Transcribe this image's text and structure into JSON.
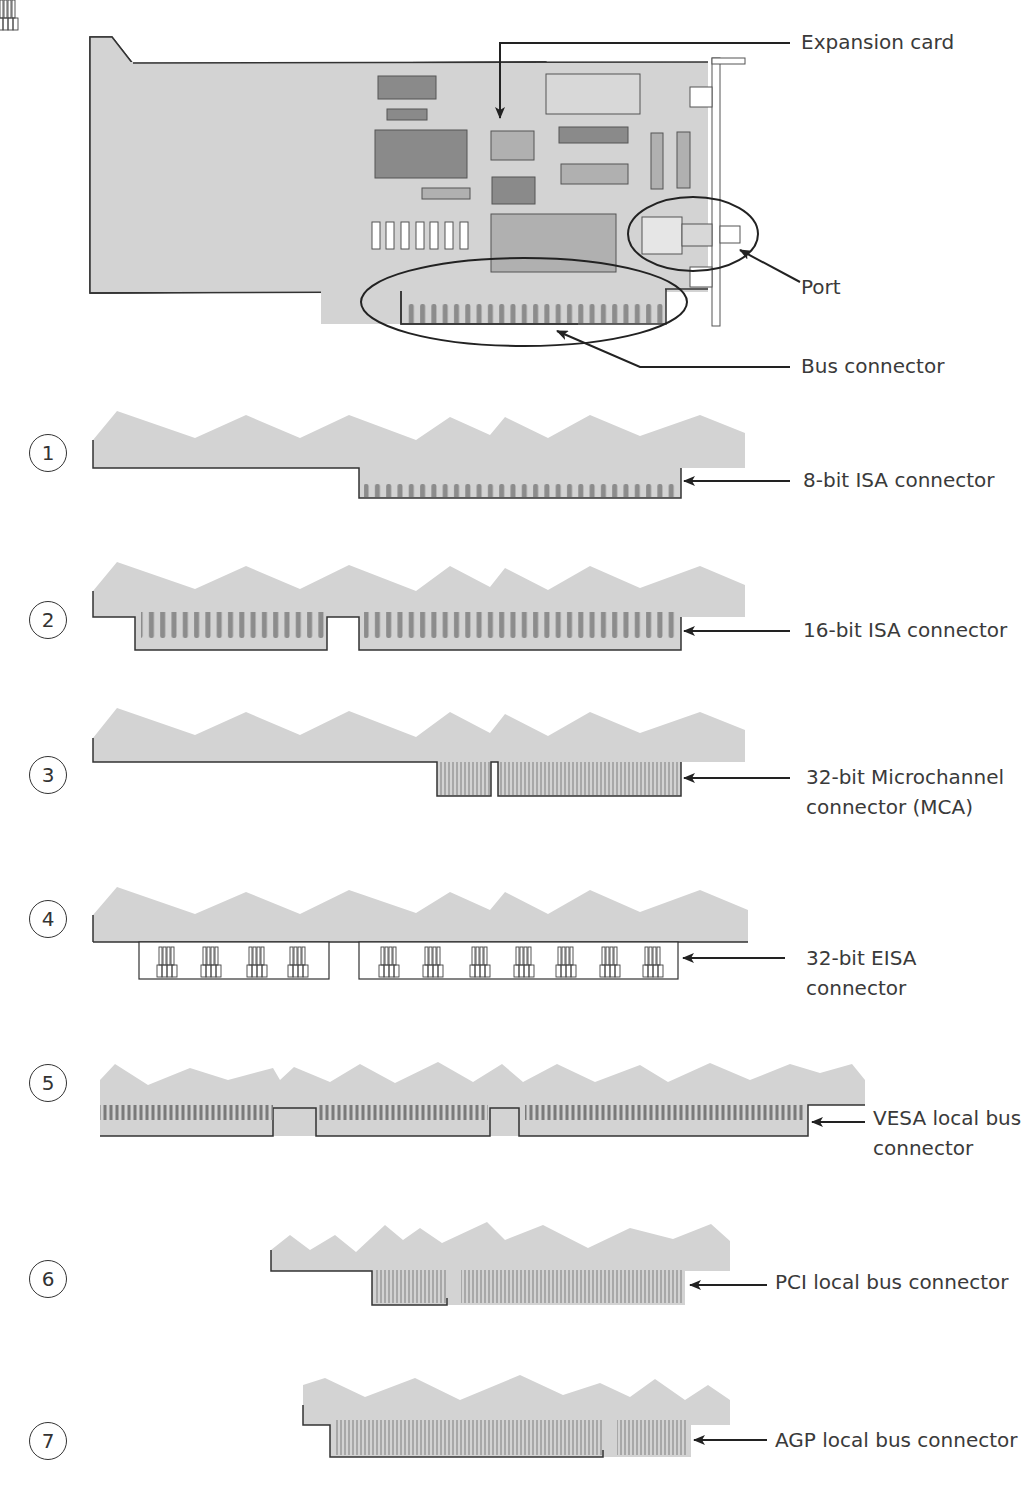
{
  "figure": {
    "top_card_labels": {
      "expansion_card": "Expansion card",
      "port": "Port",
      "bus_connector": "Bus connector"
    },
    "connectors": [
      {
        "number": "1",
        "label_lines": [
          "8-bit ISA connector"
        ]
      },
      {
        "number": "2",
        "label_lines": [
          "16-bit ISA connector"
        ]
      },
      {
        "number": "3",
        "label_lines": [
          "32-bit Microchannel",
          "connector (MCA)"
        ]
      },
      {
        "number": "4",
        "label_lines": [
          "32-bit EISA",
          "connector"
        ]
      },
      {
        "number": "5",
        "label_lines": [
          "VESA local bus",
          "connector"
        ]
      },
      {
        "number": "6",
        "label_lines": [
          "PCI local bus connector"
        ]
      },
      {
        "number": "7",
        "label_lines": [
          "AGP local bus connector"
        ]
      }
    ],
    "colors": {
      "card_fill": "#d3d3d3",
      "chip_dark": "#8a8a8a",
      "chip_mid": "#b0b0b0",
      "pin_fill": "#8c8c8c",
      "outline": "#333333"
    }
  }
}
